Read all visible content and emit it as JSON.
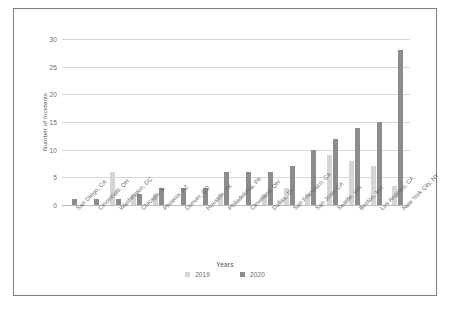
{
  "chart_data": {
    "type": "bar",
    "title": "",
    "xlabel": "Years",
    "ylabel": "Number of Incidents",
    "ylim": [
      0,
      30
    ],
    "yticks": [
      0,
      5,
      10,
      15,
      20,
      25,
      30
    ],
    "grid": true,
    "legend_position": "bottom",
    "categories": [
      "San Diego, CA",
      "Cincinnatti, OH",
      "Washington, DC",
      "Chicago, IL",
      "Phoenix, AZ",
      "Denver, CO",
      "Houston, TX",
      "Philadelphia, PA",
      "Cleveland, OH",
      "Dallas, TX",
      "San Francisco, CA",
      "San Jose, CA",
      "Seattle, WA",
      "Boston, MA",
      "Los Angeles, CA",
      "New York City, NY"
    ],
    "series": [
      {
        "name": "2019",
        "color": "#d5d5d5",
        "values": [
          0,
          0,
          6,
          2,
          2,
          0,
          0,
          2,
          0,
          2,
          3,
          2,
          9,
          8,
          7,
          3.5
        ]
      },
      {
        "name": "2020",
        "color": "#8c8c8c",
        "values": [
          1,
          1,
          1,
          2,
          3,
          3,
          3,
          6,
          6,
          6,
          7,
          10,
          12,
          14,
          15,
          28
        ]
      }
    ]
  },
  "figure": {
    "border_color": "#7b7f85",
    "background": "#ffffff",
    "gridline_color": "#d8d8d8",
    "tick_label_color": "#6b6b6b"
  }
}
